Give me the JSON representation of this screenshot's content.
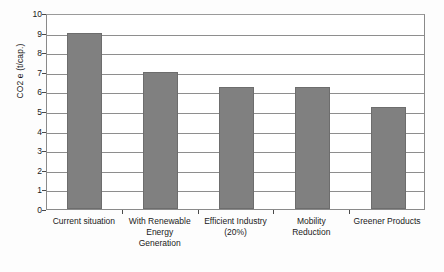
{
  "chart_data": {
    "type": "bar",
    "title": "",
    "subtitle": "",
    "xlabel": "",
    "ylabel": "CO2 e (t/cap.)",
    "categories": [
      "Current situation",
      "With Renewable Energy Generation",
      "Efficient Industry (20%)",
      "Mobility Reduction",
      "Greener Products"
    ],
    "category_lines": [
      [
        "Current situation"
      ],
      [
        "With Renewable",
        "Energy",
        "Generation"
      ],
      [
        "Efficient Industry",
        "(20%)"
      ],
      [
        "Mobility",
        "Reduction"
      ],
      [
        "Greener Products"
      ]
    ],
    "values": [
      9.0,
      7.0,
      6.2,
      6.2,
      5.2
    ],
    "ylim": [
      0,
      10
    ],
    "ytick_step": 1,
    "ytick_labels": [
      "10",
      "9",
      "8",
      "7",
      "6",
      "5",
      "4",
      "3",
      "2",
      "1",
      "0"
    ],
    "grid": true,
    "legend": "none",
    "bar_color": "#808080",
    "bar_edge_color": "#6d6d6d",
    "gridline_color": "#8e8e8e",
    "axis_color": "#4a4a4a",
    "text_color": "#1a1a1a",
    "background_color": "#ffffff"
  }
}
